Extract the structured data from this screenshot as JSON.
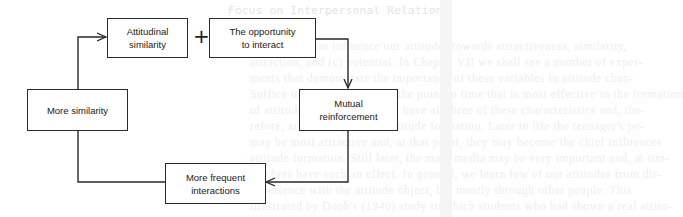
{
  "background": {
    "ghost_header": "Focus on Interpersonal Relations",
    "ghost_lines": [
      "The person can influence our attitudes towards attractiveness, similarity,",
      "attraction, and (c) potential. In Chapter VII we shall see a number of exper-",
      "ments that demonstrate the importance of these variables in attitude chan-",
      "Suffice it to say here that at the point in time that is most effective in the formation",
      "of attitudes, a child's parents have all three of these characteristics and, the-",
      "refore, are chief agents of attitude formation. Later in life the teenager's pe-",
      "may be most attractive and, at that point, they may become the chief influences",
      "attitude formation. Still later, the mass media may be very important and, at tim-",
      "teachers have such an effect. In general, we learn few of our attitudes from dir-",
      "experience with the attitude object, but mostly through other people. This",
      "illustrated by Doob's (1940) study in which students who had shown a real attitu-"
    ]
  },
  "diagram": {
    "operator": "+",
    "nodes": [
      {
        "id": "attitudinal-similarity",
        "lines": [
          "Attitudinal",
          "similarity"
        ]
      },
      {
        "id": "opportunity-to-interact",
        "lines": [
          "The opportunity",
          "to interact"
        ]
      },
      {
        "id": "mutual-reinforcement",
        "lines": [
          "Mutual",
          "reinforcement"
        ]
      },
      {
        "id": "more-frequent-interactions",
        "lines": [
          "More frequent",
          "interactions"
        ]
      },
      {
        "id": "more-similarity",
        "lines": [
          "More similarity"
        ]
      }
    ],
    "edges": [
      {
        "from": "opportunity-to-interact",
        "to": "mutual-reinforcement"
      },
      {
        "from": "mutual-reinforcement",
        "to": "more-frequent-interactions"
      },
      {
        "from": "more-frequent-interactions",
        "to": "more-similarity"
      },
      {
        "from": "more-similarity",
        "to": "attitudinal-similarity"
      }
    ],
    "colors": {
      "stroke": "#2a2a2a",
      "text": "#1a1a1a",
      "background": "#ffffff",
      "ghost_text": "#eeeeee"
    }
  }
}
